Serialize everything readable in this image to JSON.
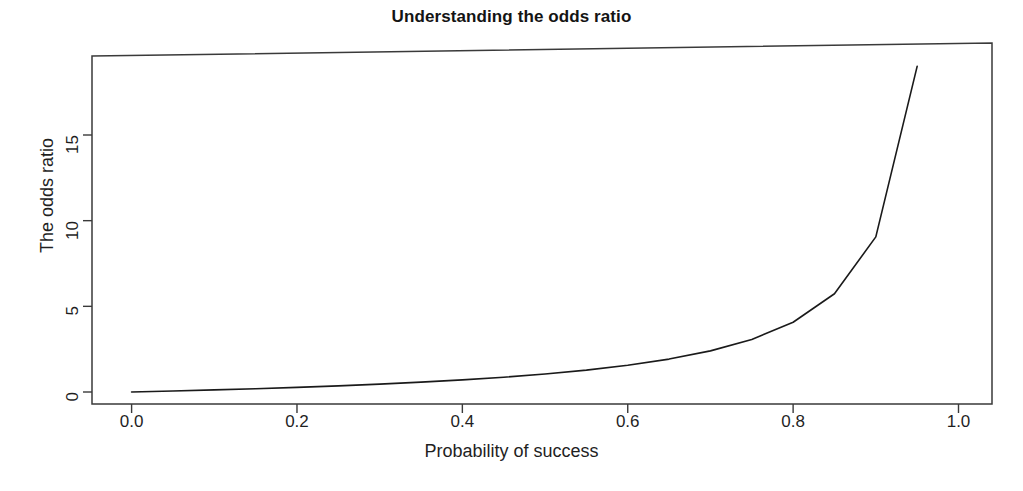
{
  "chart_data": {
    "type": "line",
    "title": "Understanding the odds ratio",
    "xlabel": "Probability of success",
    "ylabel": "The odds ratio",
    "xlim": [
      -0.002,
      1.04
    ],
    "ylim": [
      -0.3,
      19.9
    ],
    "grid": false,
    "legend": null,
    "xticks": [
      "0.0",
      "0.2",
      "0.4",
      "0.6",
      "0.8",
      "1.0"
    ],
    "xtick_values": [
      0.0,
      0.2,
      0.4,
      0.6,
      0.8,
      1.0
    ],
    "yticks": [
      "0",
      "5",
      "10",
      "15"
    ],
    "ytick_values": [
      0,
      5,
      10,
      15
    ],
    "series": [
      {
        "name": "odds = p/(1-p)",
        "color": "#1a1a1a",
        "linewidth": 1.6,
        "x": [
          0.0,
          0.05,
          0.1,
          0.15,
          0.2,
          0.25,
          0.3,
          0.35,
          0.4,
          0.45,
          0.5,
          0.55,
          0.6,
          0.65,
          0.7,
          0.75,
          0.8,
          0.85,
          0.9,
          0.95
        ],
        "y": [
          0.0,
          0.053,
          0.111,
          0.176,
          0.25,
          0.333,
          0.429,
          0.538,
          0.667,
          0.818,
          1.0,
          1.222,
          1.5,
          1.857,
          2.333,
          3.0,
          4.0,
          5.667,
          9.0,
          19.0
        ]
      }
    ]
  },
  "figure": {
    "background": "#ffffff",
    "axis_color": "#3a3a3a",
    "text_color": "#1f1f1f"
  }
}
